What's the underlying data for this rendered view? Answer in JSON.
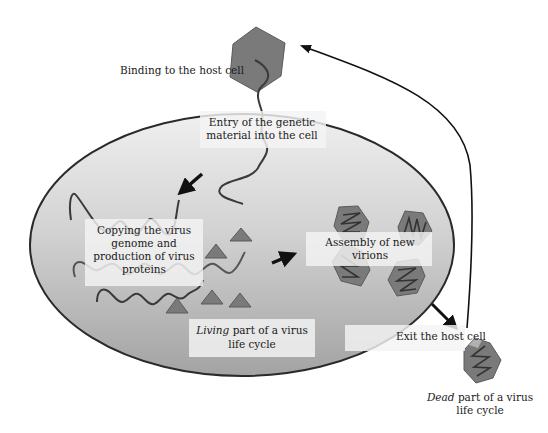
{
  "diagram": {
    "title": "Virus life cycle",
    "colors": {
      "cell_fill_top": "#ececec",
      "cell_fill_bottom": "#a8a8a8",
      "cell_stroke": "#2a2a2a",
      "capsid_fill": "#7a7a7a",
      "capsid_stroke": "#555555",
      "protein_fill": "#777777",
      "strand": "#3a3a3a",
      "arrow": "#111111",
      "label_bg": "#f4f4f4"
    },
    "labels": {
      "binding": "Binding to the host cell",
      "entry_line1": "Entry of the genetic",
      "entry_line2": "material into the cell",
      "copying_line1": "Copying the virus",
      "copying_line2": "genome and",
      "copying_line3": "production of virus",
      "copying_line4": "proteins",
      "assembly_line1": "Assembly of new",
      "assembly_line2": "virions",
      "living_italic": "Living",
      "living_rest": " part of a virus",
      "living_line2": "life cycle",
      "exit": "Exit the host cell",
      "dead_italic": "Dead",
      "dead_rest": " part of a virus",
      "dead_line2": "life cycle"
    },
    "stages": [
      "Binding to the host cell",
      "Entry of the genetic material into the cell",
      "Copying the virus genome and production of virus proteins",
      "Assembly of new virions",
      "Exit the host cell"
    ]
  }
}
